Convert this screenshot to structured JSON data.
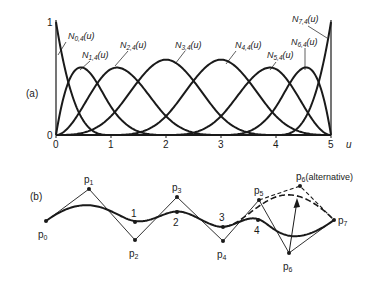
{
  "panel_a": {
    "label": "(a)",
    "x_axis_label": "u",
    "x_ticks": [
      "0",
      "1",
      "2",
      "3",
      "4",
      "5"
    ],
    "y_ticks": [
      "0",
      "1"
    ],
    "order": 4,
    "knots": [
      0,
      0,
      0,
      0,
      1,
      2,
      3,
      4,
      5,
      5,
      5,
      5
    ],
    "basis_labels": [
      {
        "name": "N",
        "sub": "0,4",
        "arg": "(u)",
        "x": 68,
        "y": 39,
        "lx1": 66,
        "ly1": 42,
        "lx2": 58,
        "ly2": 55
      },
      {
        "name": "N",
        "sub": "1,4",
        "arg": "(u)",
        "x": 82,
        "y": 58,
        "lx1": 90,
        "ly1": 61,
        "lx2": 80,
        "ly2": 70
      },
      {
        "name": "N",
        "sub": "2,4",
        "arg": "(u)",
        "x": 120,
        "y": 48,
        "lx1": 128,
        "ly1": 51,
        "lx2": 115,
        "ly2": 66
      },
      {
        "name": "N",
        "sub": "3,4",
        "arg": "(u)",
        "x": 175,
        "y": 48,
        "lx1": 185,
        "ly1": 51,
        "lx2": 175,
        "ly2": 64
      },
      {
        "name": "N",
        "sub": "4,4",
        "arg": "(u)",
        "x": 235,
        "y": 48,
        "lx1": 236,
        "ly1": 51,
        "lx2": 226,
        "ly2": 64
      },
      {
        "name": "N",
        "sub": "5,4",
        "arg": "(u)",
        "x": 267,
        "y": 58,
        "lx1": 276,
        "ly1": 62,
        "lx2": 270,
        "ly2": 70
      },
      {
        "name": "N",
        "sub": "6,4",
        "arg": "(u)",
        "x": 291,
        "y": 45,
        "lx1": 305,
        "ly1": 48,
        "lx2": 305,
        "ly2": 70
      },
      {
        "name": "N",
        "sub": "7,4",
        "arg": "(u)",
        "x": 292,
        "y": 22,
        "lx1": 308,
        "ly1": 26,
        "lx2": 327,
        "ly2": 38
      }
    ]
  },
  "panel_b": {
    "label": "(b)",
    "control_points": [
      {
        "name": "p",
        "sub": "0",
        "x": 46,
        "y": 221,
        "lx": 38,
        "ly": 238
      },
      {
        "name": "p",
        "sub": "1",
        "x": 89,
        "y": 189,
        "lx": 84,
        "ly": 183
      },
      {
        "name": "p",
        "sub": "2",
        "x": 135,
        "y": 240,
        "lx": 129,
        "ly": 257
      },
      {
        "name": "p",
        "sub": "3",
        "x": 177,
        "y": 197,
        "lx": 172,
        "ly": 191
      },
      {
        "name": "p",
        "sub": "4",
        "x": 223,
        "y": 241,
        "lx": 217,
        "ly": 258
      },
      {
        "name": "p",
        "sub": "5",
        "x": 259,
        "y": 200,
        "lx": 254,
        "ly": 194
      },
      {
        "name": "p",
        "sub": "6",
        "x": 289,
        "y": 253,
        "lx": 283,
        "ly": 270
      },
      {
        "name": "p",
        "sub": "7",
        "x": 334,
        "y": 220,
        "lx": 338,
        "ly": 224
      }
    ],
    "alternative_point": {
      "name": "p",
      "sub": "6",
      "suffix": "(alternative)",
      "x": 300,
      "y": 186,
      "lx": 296,
      "ly": 180
    },
    "knot_points": [
      {
        "label": "1",
        "x": 135,
        "y": 222,
        "lx": 131,
        "ly": 217
      },
      {
        "label": "2",
        "x": 177,
        "y": 212,
        "lx": 173,
        "ly": 226
      },
      {
        "label": "3",
        "x": 223,
        "y": 227,
        "lx": 219,
        "ly": 221
      },
      {
        "label": "4",
        "x": 258,
        "y": 220,
        "lx": 254,
        "ly": 234
      }
    ]
  },
  "colors": {
    "ink": "#1a1a1a",
    "background": "#ffffff"
  }
}
